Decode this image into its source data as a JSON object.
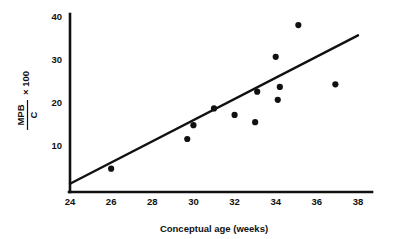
{
  "chart_data": {
    "type": "scatter",
    "title": "",
    "xlabel": "Conceptual age (weeks)",
    "ylabel_numerator": "MPB",
    "ylabel_denominator": "C",
    "ylabel_suffix": "× 100",
    "xlim": [
      24,
      38
    ],
    "ylim": [
      0,
      40
    ],
    "xticks": [
      24,
      26,
      28,
      30,
      32,
      34,
      36,
      38
    ],
    "xtick_labels": [
      "24",
      "26",
      "28",
      "30",
      "32",
      "34",
      "36",
      "38"
    ],
    "yticks": [
      10,
      20,
      30,
      40
    ],
    "ytick_labels": [
      "10",
      "20",
      "30",
      "40"
    ],
    "grid": false,
    "legend": null,
    "marker": "filled-circle",
    "marker_color": "#111111",
    "line_color": "#111111",
    "axis_color": "#111111",
    "points": [
      {
        "x": 26.0,
        "y": 4.5
      },
      {
        "x": 29.7,
        "y": 11.4
      },
      {
        "x": 30.0,
        "y": 14.6
      },
      {
        "x": 31.0,
        "y": 18.5
      },
      {
        "x": 32.0,
        "y": 17.0
      },
      {
        "x": 33.0,
        "y": 15.3
      },
      {
        "x": 33.1,
        "y": 22.4
      },
      {
        "x": 34.0,
        "y": 30.5
      },
      {
        "x": 34.2,
        "y": 23.5
      },
      {
        "x": 34.1,
        "y": 20.5
      },
      {
        "x": 35.1,
        "y": 37.9
      },
      {
        "x": 36.9,
        "y": 24.1
      }
    ],
    "fit_line": {
      "name": "regression line",
      "x": [
        24.0,
        38.0
      ],
      "y": [
        1.0,
        35.5
      ]
    }
  }
}
